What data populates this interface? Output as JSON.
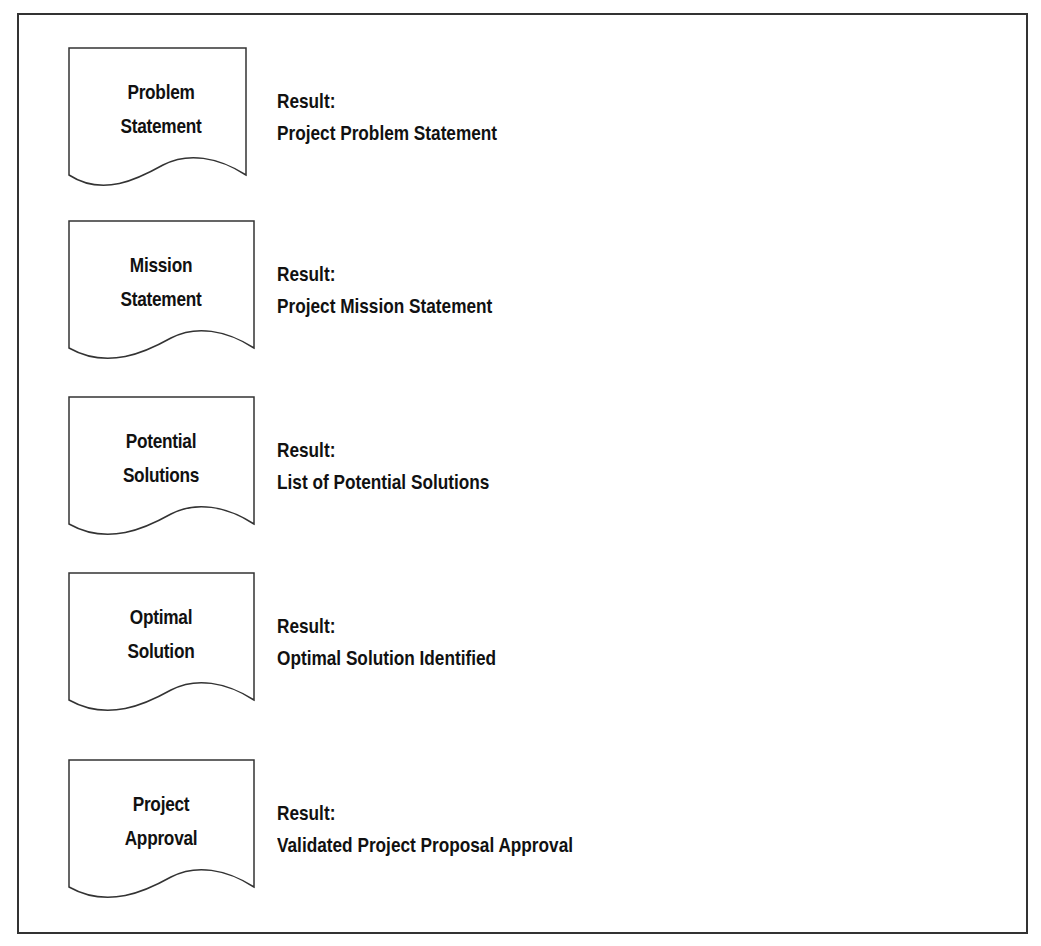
{
  "diagram": {
    "steps": [
      {
        "box_line1": "Problem",
        "box_line2": "Statement",
        "result_label": "Result:",
        "result_text": "Project Problem Statement"
      },
      {
        "box_line1": "Mission",
        "box_line2": "Statement",
        "result_label": "Result:",
        "result_text": "Project Mission Statement"
      },
      {
        "box_line1": "Potential",
        "box_line2": "Solutions",
        "result_label": "Result:",
        "result_text": "List of Potential Solutions"
      },
      {
        "box_line1": "Optimal",
        "box_line2": "Solution",
        "result_label": "Result:",
        "result_text": "Optimal Solution Identified"
      },
      {
        "box_line1": "Project",
        "box_line2": "Approval",
        "result_label": "Result:",
        "result_text": "Validated Project Proposal Approval"
      }
    ]
  }
}
